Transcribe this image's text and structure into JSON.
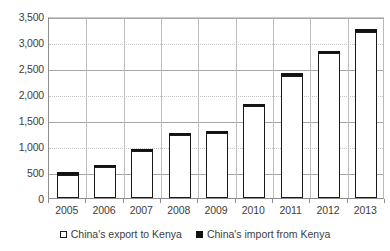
{
  "chart_data": {
    "type": "bar",
    "subtype": "stacked-column",
    "title": "",
    "subtitle": "",
    "xlabel": "",
    "ylabel": "",
    "categories": [
      "2005",
      "2006",
      "2007",
      "2008",
      "2009",
      "2010",
      "2011",
      "2012",
      "2013"
    ],
    "series": [
      {
        "name": "China's export to Kenya",
        "fill": "#ffffff",
        "edge": "#1a1a1a",
        "values": [
          450,
          600,
          910,
          1215,
          1250,
          1770,
          2355,
          2780,
          3185
        ]
      },
      {
        "name": "China's import from Kenya",
        "fill": "#121212",
        "edge": "#121212",
        "values": [
          30,
          35,
          40,
          45,
          45,
          45,
          50,
          55,
          65
        ]
      }
    ],
    "totals": [
      480,
      635,
      950,
      1260,
      1295,
      1815,
      2405,
      2835,
      3250
    ],
    "ylim": [
      0,
      3500
    ],
    "ytick_values": [
      0,
      500,
      1000,
      1500,
      2000,
      2500,
      3000,
      3500
    ],
    "ytick_labels": [
      "0",
      "500",
      "1,000",
      "1,500",
      "2,000",
      "2,500",
      "3,000",
      "3,500"
    ],
    "grid": true,
    "grid_axis": "y",
    "legend_position": "bottom-center",
    "legend": [
      "China's export to Kenya",
      "China's import from Kenya"
    ],
    "annotations": []
  },
  "axes": {
    "y": {
      "ticks": [
        {
          "label": "3,500",
          "value": 3500
        },
        {
          "label": "3,000",
          "value": 3000
        },
        {
          "label": "2,500",
          "value": 2500
        },
        {
          "label": "2,000",
          "value": 2000
        },
        {
          "label": "1,500",
          "value": 1500
        },
        {
          "label": "1,000",
          "value": 1000
        },
        {
          "label": "500",
          "value": 500
        },
        {
          "label": "0",
          "value": 0
        }
      ]
    },
    "x": {
      "ticks": [
        "2005",
        "2006",
        "2007",
        "2008",
        "2009",
        "2010",
        "2011",
        "2012",
        "2013"
      ]
    }
  },
  "legend": {
    "items": [
      {
        "label": "China's export to Kenya",
        "marker": "hollow-square-icon"
      },
      {
        "label": "China's import from Kenya",
        "marker": "filled-square-icon"
      }
    ]
  },
  "colors": {
    "export_fill": "#ffffff",
    "export_edge": "#1a1a1a",
    "import_fill": "#121212",
    "gridline": "#a7a7a7",
    "gridline_faint": "#c5c5c5",
    "axis": "#8d8d8d",
    "text": "#3d3d3d",
    "background": "#ffffff"
  }
}
